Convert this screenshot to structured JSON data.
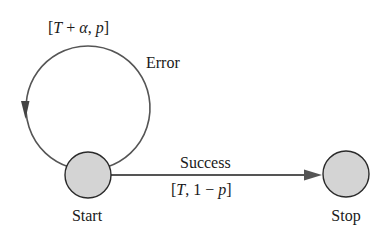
{
  "diagram": {
    "type": "state-transition",
    "colors": {
      "edge": "#555555",
      "node_fill": "#d4d4d4",
      "node_stroke": "#2a2a2a",
      "text": "#1a1a1a"
    },
    "nodes": [
      {
        "id": "start",
        "label": "Start"
      },
      {
        "id": "stop",
        "label": "Stop"
      }
    ],
    "edges": [
      {
        "from": "start",
        "to": "start",
        "label": "Error",
        "annotation": {
          "open": "[",
          "T": "T",
          "plus": " + ",
          "alpha": "α",
          "comma": ", ",
          "p": "p",
          "close": "]"
        },
        "annotation_text": "[T + α, p]"
      },
      {
        "from": "start",
        "to": "stop",
        "label": "Success",
        "annotation": {
          "open": "[",
          "T": "T",
          "comma": ", ",
          "one_minus": "1 − ",
          "p": "p",
          "close": "]"
        },
        "annotation_text": "[T, 1 − p]"
      }
    ]
  }
}
